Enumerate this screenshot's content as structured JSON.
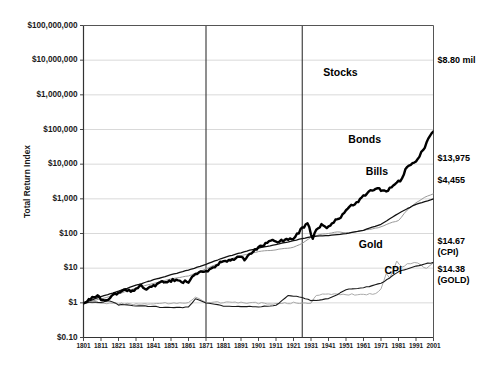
{
  "chart_data": {
    "type": "line",
    "title": "",
    "xlabel": "",
    "ylabel": "Total Return Index",
    "log_y": true,
    "ylim": [
      0.1,
      100000000
    ],
    "xlim": [
      1801,
      2001
    ],
    "grid": true,
    "legend_position": "inline-right",
    "y_ticks": [
      "$0.10",
      "$1",
      "$10",
      "$100",
      "$1,000",
      "$10,000",
      "$100,000",
      "$1,000,000",
      "$10,000,000",
      "$100,000,000"
    ],
    "y_tick_values": [
      0.1,
      1,
      10,
      100,
      1000,
      10000,
      100000,
      1000000,
      10000000,
      100000000
    ],
    "x_ticks": [
      "1801",
      "1811",
      "1821",
      "1831",
      "1841",
      "1851",
      "1861",
      "1871",
      "1881",
      "1891",
      "1901",
      "1911",
      "1921",
      "1931",
      "1941",
      "1951",
      "1961",
      "1971",
      "1981",
      "1991",
      "2001"
    ],
    "x_tick_values": [
      1801,
      1811,
      1821,
      1831,
      1841,
      1851,
      1861,
      1871,
      1881,
      1891,
      1901,
      1911,
      1921,
      1931,
      1941,
      1951,
      1961,
      1971,
      1981,
      1991,
      2001
    ],
    "period_dividers": [
      1871,
      1926
    ],
    "series": [
      {
        "name": "Stocks",
        "color": "#000000",
        "width": 2.4,
        "label_x": 1938,
        "label_y": 3500000,
        "end_label": "$8.80 mil",
        "end_value": 8800000,
        "x": [
          1801,
          1805,
          1809,
          1813,
          1817,
          1821,
          1825,
          1829,
          1833,
          1837,
          1841,
          1845,
          1849,
          1853,
          1857,
          1861,
          1865,
          1869,
          1873,
          1877,
          1881,
          1885,
          1889,
          1893,
          1897,
          1901,
          1905,
          1909,
          1913,
          1917,
          1921,
          1925,
          1929,
          1932,
          1935,
          1937,
          1940,
          1945,
          1949,
          1953,
          1957,
          1961,
          1965,
          1969,
          1973,
          1975,
          1979,
          1982,
          1985,
          1987,
          1990,
          1993,
          1996,
          1999,
          2001
        ],
        "y": [
          1,
          1.35,
          1.5,
          1.1,
          1.6,
          1.9,
          2.4,
          2.2,
          3.2,
          2.6,
          3.0,
          3.8,
          4.0,
          4.6,
          3.9,
          4.2,
          7.0,
          8.4,
          9.0,
          11.5,
          17,
          16,
          21,
          18,
          27,
          38,
          52,
          66,
          58,
          70,
          72,
          125,
          200,
          72,
          150,
          170,
          135,
          240,
          330,
          620,
          760,
          1150,
          1700,
          1900,
          1750,
          1700,
          2750,
          3200,
          7000,
          9000,
          11000,
          17000,
          32000,
          66000,
          88000
        ]
      },
      {
        "name": "Bonds",
        "color": "#999999",
        "width": 1.0,
        "label_x": 1971,
        "label_y": 42000,
        "end_label": "$13,975",
        "end_value": 13975,
        "x": [
          1801,
          1811,
          1821,
          1831,
          1841,
          1851,
          1861,
          1871,
          1881,
          1891,
          1901,
          1911,
          1921,
          1926,
          1931,
          1936,
          1941,
          1946,
          1951,
          1956,
          1961,
          1966,
          1971,
          1976,
          1981,
          1986,
          1991,
          1996,
          2001
        ],
        "y": [
          1,
          1.3,
          1.8,
          2.7,
          3.6,
          4.9,
          6.0,
          9.5,
          16,
          23,
          30,
          34,
          40,
          52,
          78,
          93,
          100,
          112,
          105,
          110,
          125,
          135,
          155,
          200,
          235,
          480,
          780,
          1100,
          1400
        ]
      },
      {
        "name": "Bills",
        "color": "#111111",
        "width": 1.3,
        "label_x": 1975,
        "label_y": 5000,
        "end_label": "$4,455",
        "end_value": 4455,
        "x": [
          1801,
          1811,
          1821,
          1831,
          1841,
          1851,
          1861,
          1871,
          1881,
          1891,
          1901,
          1911,
          1921,
          1931,
          1941,
          1951,
          1961,
          1971,
          1981,
          1991,
          2001
        ],
        "y": [
          1,
          1.5,
          2.2,
          3.2,
          4.6,
          6.4,
          8.8,
          13,
          20,
          28,
          38,
          48,
          62,
          80,
          88,
          98,
          125,
          185,
          380,
          700,
          1000
        ]
      },
      {
        "name": "Gold",
        "color": "#aaaaaa",
        "width": 1.0,
        "label_x": 1972,
        "label_y": 38,
        "end_label": "$14.38",
        "end_label2": "(GOLD)",
        "end_value": 14.38,
        "x": [
          1801,
          1811,
          1821,
          1831,
          1841,
          1851,
          1861,
          1865,
          1871,
          1881,
          1891,
          1901,
          1911,
          1921,
          1926,
          1931,
          1934,
          1941,
          1951,
          1961,
          1968,
          1971,
          1974,
          1976,
          1980,
          1983,
          1986,
          1990,
          1994,
          1997,
          2001
        ],
        "y": [
          1,
          1.0,
          0.95,
          0.92,
          0.95,
          0.98,
          1.0,
          1.45,
          1.05,
          1.02,
          1.0,
          0.98,
          0.95,
          1.0,
          0.98,
          1.0,
          1.7,
          1.75,
          1.75,
          1.75,
          1.8,
          2.6,
          7.0,
          5.0,
          16,
          11,
          13,
          15,
          12,
          10,
          14.38
        ]
      },
      {
        "name": "CPI",
        "color": "#1a1a1a",
        "width": 1.1,
        "label_x": 1983,
        "label_y": 7.0,
        "end_label": "$14.67",
        "end_label2": "(CPI)",
        "end_value": 14.67,
        "x": [
          1801,
          1811,
          1816,
          1821,
          1831,
          1841,
          1851,
          1861,
          1865,
          1871,
          1881,
          1891,
          1901,
          1911,
          1918,
          1921,
          1926,
          1931,
          1934,
          1941,
          1946,
          1951,
          1961,
          1971,
          1976,
          1981,
          1986,
          1991,
          1996,
          2001
        ],
        "y": [
          1,
          1.05,
          1.15,
          0.88,
          0.82,
          0.78,
          0.72,
          0.75,
          1.3,
          1.0,
          0.82,
          0.78,
          0.78,
          0.85,
          1.6,
          1.55,
          1.45,
          1.15,
          1.2,
          1.3,
          1.75,
          2.4,
          2.7,
          3.6,
          5.2,
          8.0,
          9.6,
          11.5,
          13.2,
          14.67
        ]
      }
    ]
  }
}
